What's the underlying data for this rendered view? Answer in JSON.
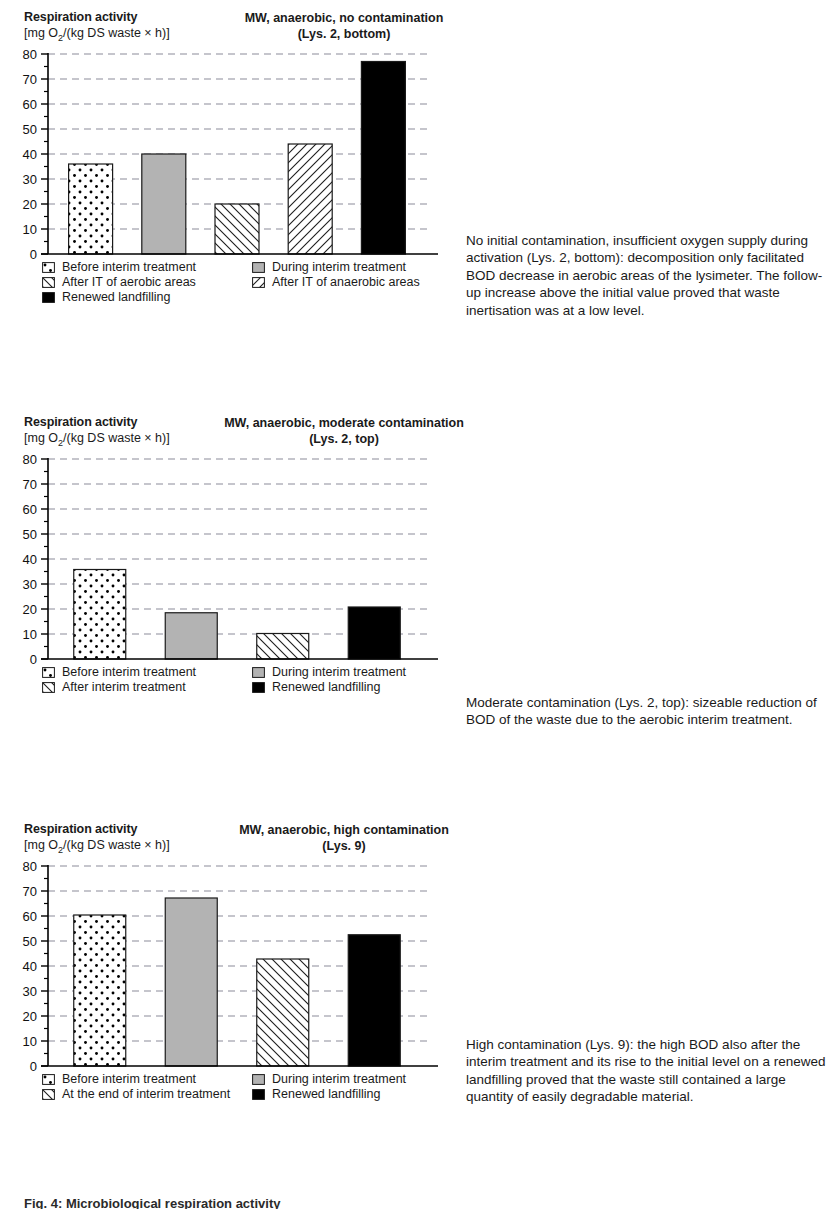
{
  "panels": [
    {
      "y_axis_label": "Respiration activity",
      "y_axis_unit": "[mg O/(kg DS waste × h)]",
      "y_axis_unit_sub": "2",
      "title_line1": "MW, anaerobic, no contamination",
      "title_line2": "(Lys. 2, bottom)",
      "note": "No initial contamination, insufficient oxygen supply during activation (Lys. 2, bottom): decomposition only facilitated BOD decrease in aerobic areas of the lysimeter. The follow-up increase above the initial value proved that waste inertisation was at a low level.",
      "legend": [
        {
          "label": "Before interim treatment",
          "pattern": "dots"
        },
        {
          "label": "During interim treatment",
          "pattern": "gray"
        },
        {
          "label": "After IT of aerobic areas",
          "pattern": "hatch-back"
        },
        {
          "label": "After IT of anaerobic areas",
          "pattern": "hatch-fwd"
        },
        {
          "label": "Renewed landfilling",
          "pattern": "black"
        }
      ],
      "chart_data": {
        "type": "bar",
        "title": "MW, anaerobic, no contamination (Lys. 2, bottom)",
        "xlabel": "",
        "ylabel": "Respiration activity [mg O2/(kg DS waste × h)]",
        "ylim": [
          0,
          80
        ],
        "yticks": [
          0,
          10,
          20,
          30,
          40,
          50,
          60,
          70,
          80
        ],
        "grid": true,
        "legend_position": "below-plot",
        "categories": [
          "Before interim treatment",
          "During interim treatment",
          "After IT of aerobic areas",
          "After IT of anaerobic areas",
          "Renewed landfilling"
        ],
        "values": [
          36,
          40,
          20,
          44,
          77
        ],
        "patterns": [
          "dots",
          "gray",
          "hatch-back",
          "hatch-fwd",
          "black"
        ]
      }
    },
    {
      "y_axis_label": "Respiration activity",
      "y_axis_unit": "[mg O/(kg DS waste × h)]",
      "y_axis_unit_sub": "2",
      "title_line1": "MW, anaerobic, moderate contamination",
      "title_line2": "(Lys. 2, top)",
      "note": "Moderate contamination (Lys. 2, top): sizeable reduction of BOD of the waste due to the aerobic interim treatment.",
      "legend": [
        {
          "label": "Before interim treatment",
          "pattern": "dots"
        },
        {
          "label": "During interim treatment",
          "pattern": "gray"
        },
        {
          "label": "After interim treatment",
          "pattern": "hatch-back"
        },
        {
          "label": "Renewed landfilling",
          "pattern": "black"
        }
      ],
      "chart_data": {
        "type": "bar",
        "title": "MW, anaerobic, moderate contamination (Lys. 2, top)",
        "xlabel": "",
        "ylabel": "Respiration activity [mg O2/(kg DS waste × h)]",
        "ylim": [
          0,
          80
        ],
        "yticks": [
          0,
          10,
          20,
          30,
          40,
          50,
          60,
          70,
          80
        ],
        "grid": true,
        "legend_position": "below-plot",
        "categories": [
          "Before interim treatment",
          "During interim treatment",
          "After interim treatment",
          "Renewed landfilling"
        ],
        "values": [
          35.8,
          18.5,
          10.2,
          20.8
        ],
        "patterns": [
          "dots",
          "gray",
          "hatch-back",
          "black"
        ]
      }
    },
    {
      "y_axis_label": "Respiration activity",
      "y_axis_unit": "[mg O/(kg DS waste × h)]",
      "y_axis_unit_sub": "2",
      "title_line1": "MW, anaerobic, high contamination",
      "title_line2": "(Lys. 9)",
      "note": "High contamination (Lys. 9): the high BOD also after the interim treatment and its rise to the initial level on a renewed landfilling proved that the waste still contained a large quantity of easily degradable material.",
      "legend": [
        {
          "label": "Before interim treatment",
          "pattern": "dots"
        },
        {
          "label": "During interim treatment",
          "pattern": "gray"
        },
        {
          "label": "At the end of interim treatment",
          "pattern": "hatch-back"
        },
        {
          "label": "Renewed landfilling",
          "pattern": "black"
        }
      ],
      "chart_data": {
        "type": "bar",
        "title": "MW, anaerobic, high contamination (Lys. 9)",
        "xlabel": "",
        "ylabel": "Respiration activity [mg O2/(kg DS waste × h)]",
        "ylim": [
          0,
          80
        ],
        "yticks": [
          0,
          10,
          20,
          30,
          40,
          50,
          60,
          70,
          80
        ],
        "grid": true,
        "legend_position": "below-plot",
        "categories": [
          "Before interim treatment",
          "During interim treatment",
          "At the end of interim treatment",
          "Renewed landfilling"
        ],
        "values": [
          60.4,
          67.2,
          42.8,
          52.5
        ],
        "patterns": [
          "dots",
          "gray",
          "hatch-back",
          "black"
        ]
      }
    }
  ],
  "caption": "Fig. 4: Microbiological respiration activity",
  "colors": {
    "gray_fill": "#b3b3b3",
    "black_fill": "#000000",
    "grid": "#8c8c99",
    "axis": "#000000"
  }
}
